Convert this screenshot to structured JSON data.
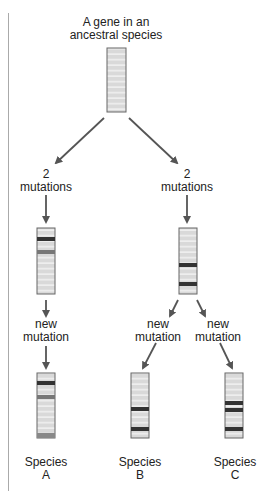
{
  "title": "A gene in an\nancestral species",
  "labels": {
    "left_mut": "2\nmutations",
    "right_mut": "2\nmutations",
    "new_a": "new\nmutation",
    "new_b": "new\nmutation",
    "new_c": "new\nmutation",
    "species_a": "Species\nA",
    "species_b": "Species\nB",
    "species_c": "Species\nC"
  },
  "colors": {
    "bar_fill": "#d9d9d9",
    "stripe": "#f2f2f2",
    "dark_band": "#333333",
    "medium_band": "#777777",
    "arrow": "#555555"
  }
}
